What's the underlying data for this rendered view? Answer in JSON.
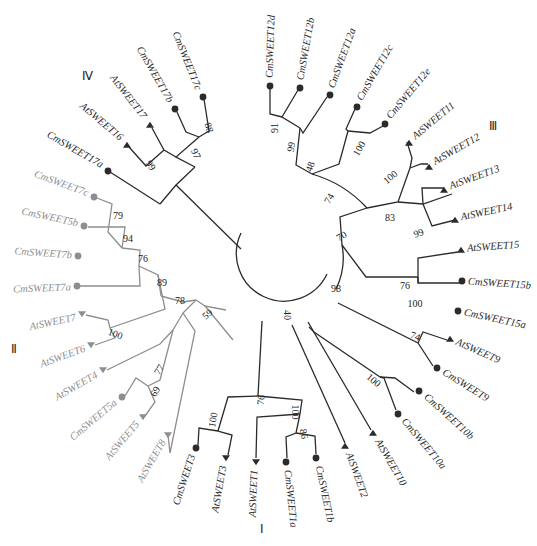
{
  "figure": {
    "type": "circular-phylogenetic-tree",
    "colors": {
      "dark": "#2b2b2b",
      "grey": "#8e8e8e",
      "background": "#ffffff"
    },
    "markers": {
      "Cm": "circle",
      "At": "triangle"
    },
    "clades": [
      {
        "id": "I",
        "label": "Ⅰ",
        "x": 262,
        "y": 533
      },
      {
        "id": "II",
        "label": "Ⅱ",
        "x": 14,
        "y": 353
      },
      {
        "id": "III",
        "label": "Ⅲ",
        "x": 493,
        "y": 130
      },
      {
        "id": "IV",
        "label": "Ⅳ",
        "x": 87,
        "y": 80
      }
    ],
    "leaves": [
      {
        "name": "CmSWEET17c",
        "x": 203,
        "y": 97,
        "tx": 198,
        "ty": 90,
        "rot": 68,
        "anchor": "end",
        "marker": "circle",
        "color": "dark"
      },
      {
        "name": "CmSWEET17b",
        "x": 175,
        "y": 109,
        "tx": 170,
        "ty": 102,
        "rot": 60,
        "anchor": "end",
        "marker": "circle",
        "color": "dark"
      },
      {
        "name": "AtSWEET17",
        "x": 150,
        "y": 125,
        "tx": 144,
        "ty": 118,
        "rot": 52,
        "anchor": "end",
        "marker": "triangle",
        "color": "dark"
      },
      {
        "name": "AtSWEET16",
        "x": 127,
        "y": 145,
        "tx": 121,
        "ty": 139,
        "rot": 40,
        "anchor": "end",
        "marker": "triangle",
        "color": "dark"
      },
      {
        "name": "CmSWEET17a",
        "x": 108,
        "y": 171,
        "tx": 102,
        "ty": 166,
        "rot": 30,
        "anchor": "end",
        "marker": "circle",
        "color": "dark"
      },
      {
        "name": "CmSWEET7c",
        "x": 94,
        "y": 197,
        "tx": 88,
        "ty": 194,
        "rot": 20,
        "anchor": "end",
        "marker": "circle",
        "color": "grey"
      },
      {
        "name": "CmSWEET5b",
        "x": 84,
        "y": 226,
        "tx": 78,
        "ty": 224,
        "rot": 12,
        "anchor": "end",
        "marker": "circle",
        "color": "grey"
      },
      {
        "name": "CmSWEET7b",
        "x": 78,
        "y": 256,
        "tx": 72,
        "ty": 256,
        "rot": 4,
        "anchor": "end",
        "marker": "circle",
        "color": "grey"
      },
      {
        "name": "CmSWEET7a",
        "x": 77,
        "y": 286,
        "tx": 71,
        "ty": 288,
        "rot": -2,
        "anchor": "end",
        "marker": "circle",
        "color": "grey"
      },
      {
        "name": "AtSWEET7",
        "x": 82,
        "y": 314,
        "tx": 76,
        "ty": 318,
        "rot": -12,
        "anchor": "end",
        "marker": "triangle-down",
        "color": "grey"
      },
      {
        "name": "AtSWEET6",
        "x": 91,
        "y": 345,
        "tx": 85,
        "ty": 349,
        "rot": -20,
        "anchor": "end",
        "marker": "triangle-down",
        "color": "grey"
      },
      {
        "name": "AtSWEET4",
        "x": 103,
        "y": 370,
        "tx": 97,
        "ty": 375,
        "rot": -30,
        "anchor": "end",
        "marker": "triangle-down",
        "color": "grey"
      },
      {
        "name": "CmSWEET5a",
        "x": 122,
        "y": 397,
        "tx": 116,
        "ty": 402,
        "rot": -40,
        "anchor": "end",
        "marker": "circle",
        "color": "grey"
      },
      {
        "name": "AtSWEET5",
        "x": 143,
        "y": 417,
        "tx": 138,
        "ty": 423,
        "rot": -50,
        "anchor": "end",
        "marker": "triangle-down",
        "color": "grey"
      },
      {
        "name": "AtSWEET8",
        "x": 168,
        "y": 435,
        "tx": 164,
        "ty": 441,
        "rot": -60,
        "anchor": "end",
        "marker": "triangle-down",
        "color": "grey"
      },
      {
        "name": "CmSWEET3",
        "x": 196,
        "y": 448,
        "tx": 193,
        "ty": 455,
        "rot": -72,
        "anchor": "end",
        "marker": "circle",
        "color": "dark"
      },
      {
        "name": "AtSWEET3",
        "x": 226,
        "y": 458,
        "tx": 224,
        "ty": 466,
        "rot": -80,
        "anchor": "end",
        "marker": "triangle-down",
        "color": "dark"
      },
      {
        "name": "AtSWEET1",
        "x": 256,
        "y": 462,
        "tx": 255,
        "ty": 470,
        "rot": -88,
        "anchor": "end",
        "marker": "triangle-down",
        "color": "dark"
      },
      {
        "name": "CmSWEET1a",
        "x": 286,
        "y": 462,
        "tx": 287,
        "ty": 470,
        "rot": 84,
        "anchor": "start",
        "marker": "circle",
        "color": "dark"
      },
      {
        "name": "CmSWEET1b",
        "x": 316,
        "y": 458,
        "tx": 318,
        "ty": 466,
        "rot": 78,
        "anchor": "start",
        "marker": "circle",
        "color": "dark"
      },
      {
        "name": "AtSWEET2",
        "x": 345,
        "y": 446,
        "tx": 348,
        "ty": 453,
        "rot": 70,
        "anchor": "start",
        "marker": "triangle",
        "color": "dark"
      },
      {
        "name": "AtSWEET10",
        "x": 373,
        "y": 433,
        "tx": 377,
        "ty": 440,
        "rot": 60,
        "anchor": "start",
        "marker": "triangle",
        "color": "dark"
      },
      {
        "name": "CmSWEET10a",
        "x": 398,
        "y": 414,
        "tx": 403,
        "ty": 420,
        "rot": 50,
        "anchor": "start",
        "marker": "circle",
        "color": "dark"
      },
      {
        "name": "CmSWEET10b",
        "x": 419,
        "y": 391,
        "tx": 425,
        "ty": 396,
        "rot": 42,
        "anchor": "start",
        "marker": "circle",
        "color": "dark"
      },
      {
        "name": "CmSWEET9",
        "x": 437,
        "y": 368,
        "tx": 443,
        "ty": 372,
        "rot": 32,
        "anchor": "start",
        "marker": "circle",
        "color": "dark"
      },
      {
        "name": "AtSWEET9",
        "x": 450,
        "y": 339,
        "tx": 456,
        "ty": 342,
        "rot": 24,
        "anchor": "start",
        "marker": "triangle",
        "color": "dark"
      },
      {
        "name": "CmSWEET15a",
        "x": 458,
        "y": 311,
        "tx": 464,
        "ty": 313,
        "rot": 12,
        "anchor": "start",
        "marker": "circle",
        "color": "dark"
      },
      {
        "name": "CmSWEET15b",
        "x": 462,
        "y": 281,
        "tx": 468,
        "ty": 282,
        "rot": 4,
        "anchor": "start",
        "marker": "circle",
        "color": "dark"
      },
      {
        "name": "AtSWEET15",
        "x": 461,
        "y": 250,
        "tx": 467,
        "ty": 249,
        "rot": -4,
        "anchor": "start",
        "marker": "triangle",
        "color": "dark"
      },
      {
        "name": "AtSWEET14",
        "x": 455,
        "y": 220,
        "tx": 461,
        "ty": 218,
        "rot": -12,
        "anchor": "start",
        "marker": "triangle",
        "color": "dark"
      },
      {
        "name": "AtSWEET13",
        "x": 444,
        "y": 190,
        "tx": 450,
        "ty": 187,
        "rot": -20,
        "anchor": "start",
        "marker": "triangle",
        "color": "dark"
      },
      {
        "name": "AtSWEET12",
        "x": 429,
        "y": 167,
        "tx": 434,
        "ty": 163,
        "rot": -30,
        "anchor": "start",
        "marker": "triangle",
        "color": "dark"
      },
      {
        "name": "AtSWEET11",
        "x": 409,
        "y": 143,
        "tx": 414,
        "ty": 138,
        "rot": -40,
        "anchor": "start",
        "marker": "triangle",
        "color": "dark"
      },
      {
        "name": "CmSWEET12e",
        "x": 385,
        "y": 124,
        "tx": 389,
        "ty": 118,
        "rot": -50,
        "anchor": "start",
        "marker": "circle",
        "color": "dark"
      },
      {
        "name": "CmSWEET12c",
        "x": 357,
        "y": 107,
        "tx": 360,
        "ty": 100,
        "rot": -60,
        "anchor": "start",
        "marker": "circle",
        "color": "dark"
      },
      {
        "name": "CmSWEET12a",
        "x": 330,
        "y": 95,
        "tx": 332,
        "ty": 88,
        "rot": -70,
        "anchor": "start",
        "marker": "circle",
        "color": "dark"
      },
      {
        "name": "CmSWEET12b",
        "x": 300,
        "y": 88,
        "tx": 301,
        "ty": 80,
        "rot": -80,
        "anchor": "start",
        "marker": "circle",
        "color": "dark"
      },
      {
        "name": "CmSWEET12d",
        "x": 270,
        "y": 86,
        "tx": 270,
        "ty": 78,
        "rot": -88,
        "anchor": "start",
        "marker": "circle",
        "color": "dark"
      }
    ],
    "bootstrap": [
      {
        "value": "88",
        "x": 208,
        "y": 128,
        "rot": 70
      },
      {
        "value": "97",
        "x": 195,
        "y": 154,
        "rot": 65
      },
      {
        "value": "99",
        "x": 150,
        "y": 166,
        "rot": 55
      },
      {
        "value": "79",
        "x": 118,
        "y": 217,
        "rot": 0
      },
      {
        "value": "94",
        "x": 128,
        "y": 240,
        "rot": 0
      },
      {
        "value": "76",
        "x": 143,
        "y": 260,
        "rot": 0
      },
      {
        "value": "89",
        "x": 162,
        "y": 284,
        "rot": 0
      },
      {
        "value": "78",
        "x": 180,
        "y": 302,
        "rot": 0
      },
      {
        "value": "59",
        "x": 208,
        "y": 315,
        "rot": -40
      },
      {
        "value": "100",
        "x": 115,
        "y": 335,
        "rot": 20
      },
      {
        "value": "77",
        "x": 160,
        "y": 370,
        "rot": -60
      },
      {
        "value": "69",
        "x": 156,
        "y": 392,
        "rot": -60
      },
      {
        "value": "100",
        "x": 214,
        "y": 420,
        "rot": -80
      },
      {
        "value": "76",
        "x": 262,
        "y": 400,
        "rot": -85
      },
      {
        "value": "100",
        "x": 294,
        "y": 412,
        "rot": 90
      },
      {
        "value": "86",
        "x": 303,
        "y": 434,
        "rot": 80
      },
      {
        "value": "40",
        "x": 286,
        "y": 315,
        "rot": 90
      },
      {
        "value": "98",
        "x": 336,
        "y": 290,
        "rot": 0
      },
      {
        "value": "70",
        "x": 342,
        "y": 237,
        "rot": -30
      },
      {
        "value": "74",
        "x": 330,
        "y": 199,
        "rot": -60
      },
      {
        "value": "48",
        "x": 311,
        "y": 167,
        "rot": -70
      },
      {
        "value": "99",
        "x": 292,
        "y": 147,
        "rot": -80
      },
      {
        "value": "91",
        "x": 276,
        "y": 128,
        "rot": -90
      },
      {
        "value": "100",
        "x": 360,
        "y": 149,
        "rot": -60
      },
      {
        "value": "100",
        "x": 391,
        "y": 178,
        "rot": -40
      },
      {
        "value": "83",
        "x": 390,
        "y": 219,
        "rot": 0
      },
      {
        "value": "99",
        "x": 419,
        "y": 234,
        "rot": -20
      },
      {
        "value": "76",
        "x": 405,
        "y": 287,
        "rot": 0
      },
      {
        "value": "100",
        "x": 415,
        "y": 305,
        "rot": 0
      },
      {
        "value": "74",
        "x": 415,
        "y": 337,
        "rot": 20
      },
      {
        "value": "100",
        "x": 373,
        "y": 381,
        "rot": 40
      }
    ]
  }
}
